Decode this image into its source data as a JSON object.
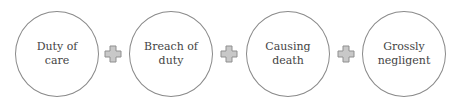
{
  "diagram": {
    "elements": [
      {
        "label": "Duty of\ncare"
      },
      {
        "label": "Breach of\nduty"
      },
      {
        "label": "Causing\ndeath"
      },
      {
        "label": "Grossly\nnegligent"
      }
    ],
    "connector": "plus-icon",
    "colors": {
      "circle_border": "#8a8a8a",
      "plus_fill": "#c8c8c8",
      "plus_border": "#8f8f8f",
      "text": "#444444"
    }
  }
}
